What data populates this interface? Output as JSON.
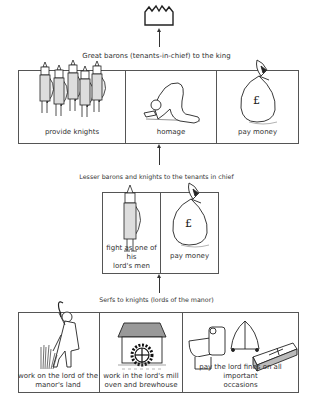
{
  "diagram": {
    "top": {
      "icon": "crown-icon"
    },
    "levels": [
      {
        "title": "Great barons (tenants-in-chief) to the king",
        "duties": [
          {
            "label": "provide knights",
            "icon": "knights-group-icon"
          },
          {
            "label": "homage",
            "icon": "kneeling-homage-icon"
          },
          {
            "label": "pay money",
            "icon": "money-bag-icon"
          }
        ]
      },
      {
        "title": "Lesser barons and knights to the tenants in chief",
        "duties": [
          {
            "label": "fight as one of his lord's men",
            "label_line1": "fight as one of his",
            "label_line2": "lord's men",
            "icon": "knight-icon"
          },
          {
            "label": "pay money",
            "icon": "money-bag-icon"
          }
        ]
      },
      {
        "title": "Serfs to knights (lords of the manor)",
        "duties": [
          {
            "label": "work on the lord of the manor's land",
            "label_line1": "work on the lord of the",
            "label_line2": "manor's land",
            "icon": "serf-with-sickle-icon"
          },
          {
            "label": "work in the lord's mill oven and brewhouse",
            "label_line1": "work in the lord's mill",
            "label_line2": "oven and brewhouse",
            "icon": "watermill-icon"
          },
          {
            "label": "pay the lord fines on all important occasions",
            "label_line1": "pay the lord fines on all important",
            "label_line2": "occasions",
            "icon": "font-bell-coffin-icon"
          }
        ]
      }
    ],
    "colors": {
      "line": "#555555",
      "text": "#333333",
      "roof_grey": "#999999",
      "coffin_grey": "#bbbbbb"
    }
  }
}
